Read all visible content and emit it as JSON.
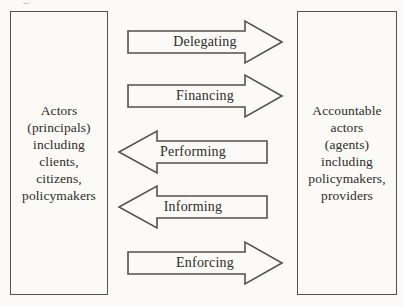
{
  "diagram": {
    "left_box": {
      "lines": [
        "Actors",
        "(principals)",
        "including",
        "clients,",
        "citizens,",
        "policymakers"
      ]
    },
    "right_box": {
      "lines": [
        "Accountable",
        "actors",
        "(agents)",
        "including",
        "policymakers,",
        "providers"
      ]
    },
    "arrows": [
      {
        "label": "Delegating",
        "direction": "right"
      },
      {
        "label": "Financing",
        "direction": "right"
      },
      {
        "label": "Performing",
        "direction": "left"
      },
      {
        "label": "Informing",
        "direction": "left"
      },
      {
        "label": "Enforcing",
        "direction": "right"
      }
    ],
    "colors": {
      "background": "#fbfaf7",
      "line": "#55524e",
      "text": "#2f2c28"
    }
  }
}
